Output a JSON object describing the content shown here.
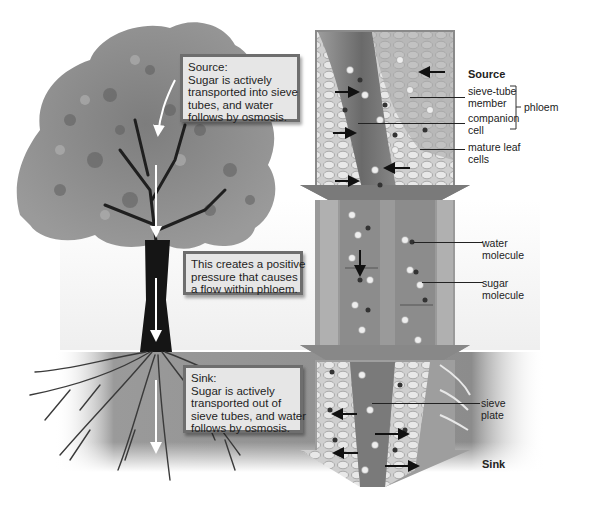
{
  "diagram": {
    "colors": {
      "background": "#ffffff",
      "callout_fill": "#e6e6e6",
      "callout_border": "#6e6e6e",
      "tree_foliage": "#8a8a8a",
      "trunk": "#1a1a1a",
      "soil_band": "#8f8f8f",
      "flow_arrow": "#ffffff",
      "text": "#222222"
    },
    "callouts": {
      "source": {
        "lines": [
          "Source:",
          "Sugar is actively",
          "transported into sieve",
          "tubes, and water",
          "follows by osmosis."
        ]
      },
      "pressure": {
        "lines": [
          "This creates a positive",
          "pressure that causes",
          "a flow within phloem."
        ]
      },
      "sink": {
        "lines": [
          "Sink:",
          "Sugar is actively",
          "transported out of",
          "sieve tubes, and water",
          "follows by osmosis."
        ]
      }
    },
    "labels": {
      "source_heading": "Source",
      "sieve_tube_member": [
        "sieve-tube",
        "member"
      ],
      "companion_cell": [
        "companion",
        "cell"
      ],
      "phloem": "phloem",
      "mature_leaf_cells": [
        "mature leaf",
        "cells"
      ],
      "water_molecule": [
        "water",
        "molecule"
      ],
      "sugar_molecule": [
        "sugar",
        "molecule"
      ],
      "sieve_plate": [
        "sieve",
        "plate"
      ],
      "sink_heading": "Sink"
    },
    "icons": {
      "flow_arrow": "down-arrow-icon",
      "transport_arrow_in": "right-arrow-icon",
      "transport_arrow_out": "left-arrow-icon",
      "bracket": "bracket-icon"
    }
  }
}
